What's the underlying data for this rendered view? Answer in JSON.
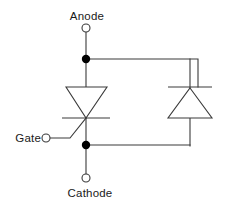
{
  "diagram": {
    "canvas": {
      "width": 228,
      "height": 207,
      "background": "#ffffff"
    },
    "line_color": "#3a3a3a",
    "dot_color": "#000000",
    "text_color": "#1a1a1a",
    "labels": {
      "anode": "Anode",
      "gate": "Gate",
      "cathode": "Cathode"
    },
    "terminals": [
      {
        "name": "anode",
        "label": "Anode",
        "x": 86,
        "y": 28,
        "radius": 4,
        "style": "open"
      },
      {
        "name": "gate",
        "label": "Gate",
        "x": 46,
        "y": 138,
        "radius": 4,
        "style": "open"
      },
      {
        "name": "cathode",
        "label": "Cathode",
        "x": 86,
        "y": 178,
        "radius": 4,
        "style": "open"
      }
    ],
    "junctions": [
      {
        "name": "anode-node",
        "x": 86,
        "y": 59,
        "radius": 4.2
      },
      {
        "name": "cathode-node",
        "x": 86,
        "y": 145,
        "radius": 4.2
      }
    ],
    "components": [
      {
        "name": "thyristor",
        "type": "scr",
        "orientation": "down",
        "triangle": {
          "apex_x": 86,
          "apex_y": 118,
          "top_left_x": 66,
          "top_right_x": 107,
          "top_y": 87
        },
        "cathode_bar": {
          "y": 118,
          "x1": 62,
          "x2": 110
        },
        "gate_line": {
          "x1": 46,
          "y1": 138,
          "x2": 70,
          "y2": 138,
          "x3": 86,
          "y3": 118
        }
      },
      {
        "name": "diode",
        "type": "diode",
        "orientation": "up",
        "triangle": {
          "apex_x": 190,
          "apex_y": 88,
          "base_left_x": 168,
          "base_right_x": 212,
          "base_y": 118
        },
        "cathode_bar": {
          "y": 87,
          "x1": 168,
          "x2": 212
        }
      }
    ],
    "wires": [
      {
        "name": "anode-lead",
        "points": "86,32 86,87"
      },
      {
        "name": "top-rail",
        "points": "86,59 198,59 198,87"
      },
      {
        "name": "diode-top-stub",
        "points": "190,59 190,88"
      },
      {
        "name": "diode-bottom-stub",
        "points": "190,118 190,145"
      },
      {
        "name": "bottom-rail",
        "points": "86,145 190,145"
      },
      {
        "name": "cathode-lead",
        "points": "86,118 86,174"
      }
    ]
  }
}
